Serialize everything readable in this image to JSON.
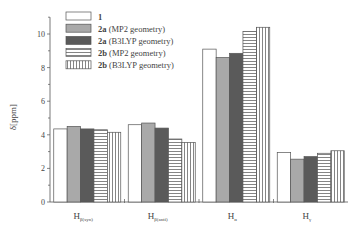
{
  "chart_data": {
    "type": "bar",
    "title": "",
    "xlabel": "",
    "ylabel": "δ[ppm]",
    "ylim": [
      0,
      11
    ],
    "yticks": [
      0,
      2,
      4,
      6,
      8,
      10
    ],
    "grid": false,
    "legend_position": "top-left (inside)",
    "categories": [
      {
        "main": "H",
        "sub": "β(syn)"
      },
      {
        "main": "H",
        "sub": "β(anti)"
      },
      {
        "main": "H",
        "sub": "α"
      },
      {
        "main": "H",
        "sub": "γ"
      }
    ],
    "series": [
      {
        "name": "1",
        "bold": "1",
        "rest": "",
        "fill": "white",
        "values": [
          4.35,
          4.6,
          9.1,
          2.95
        ]
      },
      {
        "name": "2a (MP2 geometry)",
        "bold": "2a",
        "rest": " (MP2 geometry)",
        "fill": "lightgray",
        "values": [
          4.5,
          4.7,
          8.6,
          2.55
        ]
      },
      {
        "name": "2a (B3LYP geometry)",
        "bold": "2a",
        "rest": " (B3LYP geometry)",
        "fill": "darkgray",
        "values": [
          4.35,
          4.4,
          8.85,
          2.7
        ]
      },
      {
        "name": "2b (MP2 geometry)",
        "bold": "2b",
        "rest": " (MP2 geometry)",
        "fill": "horizontal-hatch",
        "values": [
          4.3,
          3.75,
          10.15,
          2.9
        ]
      },
      {
        "name": "2b (B3LYP geometry)",
        "bold": "2b",
        "rest": " (B3LYP geometry)",
        "fill": "vertical-hatch",
        "values": [
          4.15,
          3.55,
          10.4,
          3.05
        ]
      }
    ],
    "colors": {
      "white": "#ffffff",
      "lightgray": "#a9a9a9",
      "darkgray": "#5a5a5a",
      "stroke": "#555555"
    }
  }
}
